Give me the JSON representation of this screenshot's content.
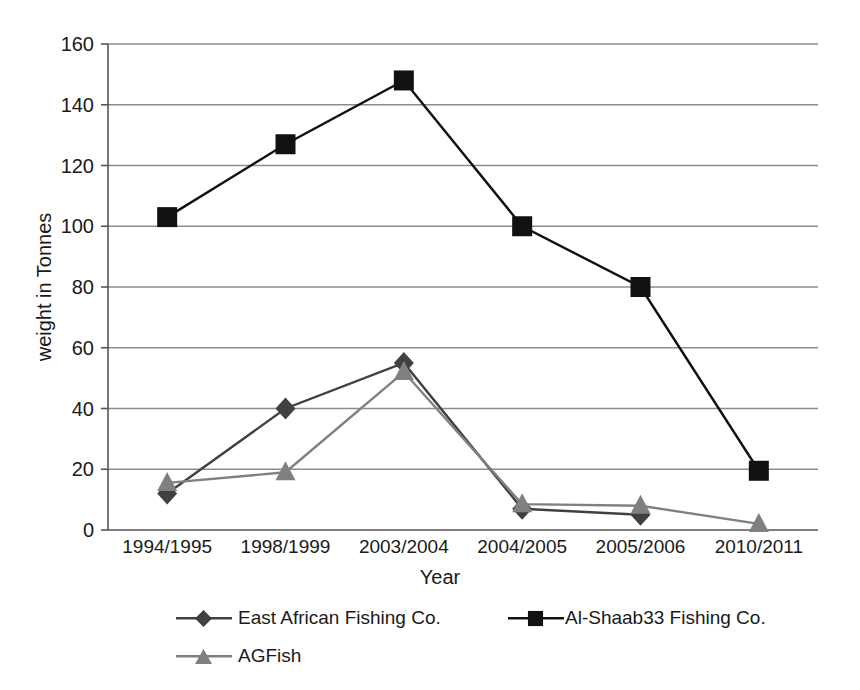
{
  "chart_data": {
    "type": "line",
    "title": "",
    "xlabel": "Year",
    "ylabel": "weight in Tonnes",
    "categories": [
      "1994/1995",
      "1998/1999",
      "2003/2004",
      "2004/2005",
      "2005/2006",
      "2010/2011"
    ],
    "ylim": [
      0,
      160
    ],
    "yticks": [
      0,
      20,
      40,
      60,
      80,
      100,
      120,
      140,
      160
    ],
    "grid": "horizontal",
    "legend_position": "bottom",
    "series": [
      {
        "name": "East African Fishing Co.",
        "marker": "diamond",
        "color": "#404040",
        "values": [
          12,
          40,
          55,
          7,
          5,
          null
        ]
      },
      {
        "name": "Al-Shaab33 Fishing Co.",
        "marker": "square",
        "color": "#111111",
        "values": [
          103,
          127,
          148,
          100,
          80,
          19.5
        ]
      },
      {
        "name": "AGFish",
        "marker": "triangle",
        "color": "#808080",
        "values": [
          15.5,
          19,
          52,
          8.5,
          8,
          2
        ]
      }
    ]
  },
  "axes": {
    "y_label": "weight in Tonnes",
    "x_label": "Year",
    "y_tick_labels": [
      "0",
      "20",
      "40",
      "60",
      "80",
      "100",
      "120",
      "140",
      "160"
    ],
    "x_tick_labels": [
      "1994/1995",
      "1998/1999",
      "2003/2004",
      "2004/2005",
      "2005/2006",
      "2010/2011"
    ]
  },
  "legend": {
    "items": [
      {
        "label": "East African Fishing Co.",
        "marker": "diamond-marker-icon",
        "color": "#404040"
      },
      {
        "label": "Al-Shaab33 Fishing Co.",
        "marker": "square-marker-icon",
        "color": "#111111"
      },
      {
        "label": "AGFish",
        "marker": "triangle-marker-icon",
        "color": "#808080"
      }
    ]
  },
  "colors": {
    "grid": "#8c8c8c",
    "axis": "#555555",
    "series_east_african": "#404040",
    "series_al_shaab33": "#111111",
    "series_agfish": "#808080",
    "background": "#ffffff"
  }
}
